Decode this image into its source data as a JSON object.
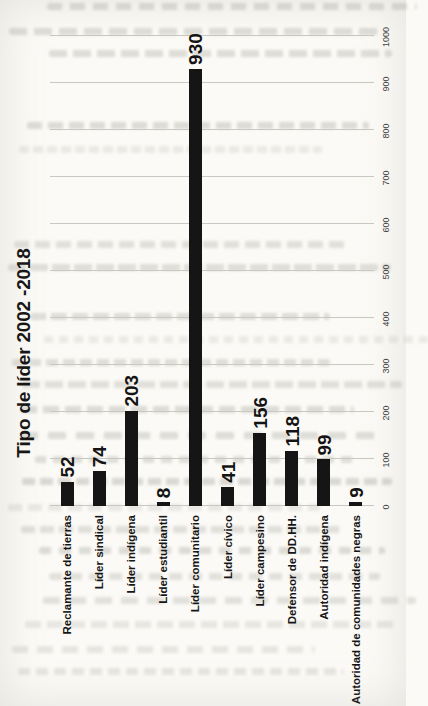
{
  "page": {
    "background_color": "#fbfaf6",
    "description": "Scanned book page; bar chart printed rotated 90 degrees counter-clockwise, faint bleed-through text from reverse side"
  },
  "chart_data": {
    "type": "bar",
    "orientation": "horizontal bars; whole chart rotated 90deg CCW on page",
    "title": "Tipo de líder 2002 -2018",
    "categories": [
      "Reclamante de tierras",
      "Líder sindical",
      "Líder indígena",
      "Líder estudiantil",
      "Líder comunitario",
      "Líder cívico",
      "Líder campesino",
      "Defensor de DD.HH.",
      "Autoridad indígena",
      "Autoridad de comunidades negras"
    ],
    "values": [
      52,
      74,
      203,
      8,
      930,
      41,
      156,
      118,
      99,
      9
    ],
    "value_axis": {
      "min": 0,
      "max": 1000,
      "tick_interval": 100,
      "tick_labels": [
        "0",
        "100",
        "200",
        "300",
        "400",
        "500",
        "600",
        "700",
        "800",
        "900",
        "1000"
      ]
    },
    "grid": true,
    "legend": false,
    "data_labels": true,
    "bar_color": "#151515",
    "gridline_color": "#c9c9c4",
    "text_color": "#141414"
  }
}
